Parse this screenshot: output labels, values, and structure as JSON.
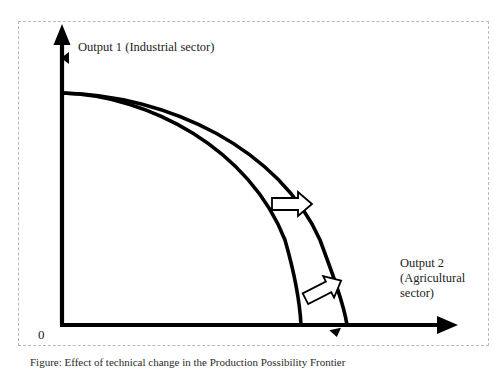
{
  "figure": {
    "type": "economics-diagram",
    "name": "production-possibility-frontier-shift",
    "background_color": "#ffffff",
    "line_color": "#000000",
    "border_color": "#b9b9b9"
  },
  "axes": {
    "y_label": "Output 1 (Industrial sector)",
    "x_label": "Output 2 (Agricultural sector)",
    "origin_label": "0"
  },
  "curves": [
    {
      "name": "inner-ppf",
      "description": "original production possibility frontier",
      "y_intercept_label": "",
      "x_intercept_label": ""
    },
    {
      "name": "outer-ppf",
      "description": "shifted outward production possibility frontier",
      "y_intercept_label": "",
      "x_intercept_label": ""
    }
  ],
  "arrows": [
    {
      "name": "upper-shift-arrow",
      "direction": "right",
      "label": ""
    },
    {
      "name": "lower-shift-arrow",
      "direction": "up-right",
      "label": ""
    }
  ],
  "caption": {
    "text": "Figure: Effect of technical change in the Production Possibility Frontier"
  }
}
